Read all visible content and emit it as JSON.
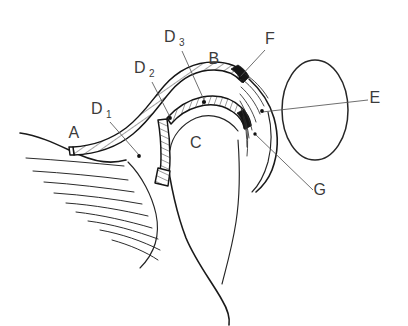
{
  "figure": {
    "background_color": "#ffffff",
    "ink_color": "#1a1a1a",
    "leader_color": "#555555",
    "width": 408,
    "height": 326
  },
  "labels": [
    {
      "id": "A",
      "text": "A",
      "subscript": "",
      "x": 74,
      "y": 138,
      "has_leader": false,
      "dot": null
    },
    {
      "id": "B",
      "text": "B",
      "subscript": "",
      "x": 214,
      "y": 64,
      "has_leader": false,
      "dot": null
    },
    {
      "id": "C",
      "text": "C",
      "subscript": "",
      "x": 196,
      "y": 148,
      "has_leader": false,
      "dot": null
    },
    {
      "id": "D1",
      "text": "D",
      "subscript": "1",
      "x": 97,
      "y": 114,
      "has_leader": true,
      "dot": [
        139,
        156
      ]
    },
    {
      "id": "D2",
      "text": "D",
      "subscript": "2",
      "x": 140,
      "y": 73,
      "has_leader": true,
      "dot": [
        170,
        118
      ]
    },
    {
      "id": "D3",
      "text": "D",
      "subscript": "3",
      "x": 170,
      "y": 42,
      "has_leader": true,
      "dot": [
        204,
        102
      ]
    },
    {
      "id": "E",
      "text": "E",
      "subscript": "",
      "x": 375,
      "y": 103,
      "has_leader": true,
      "dot": [
        262,
        111
      ]
    },
    {
      "id": "F",
      "text": "F",
      "subscript": "",
      "x": 270,
      "y": 44,
      "has_leader": true,
      "dot": [
        240,
        78
      ]
    },
    {
      "id": "G",
      "text": "G",
      "subscript": "",
      "x": 320,
      "y": 195,
      "has_leader": true,
      "dot": [
        255,
        134
      ]
    }
  ],
  "regions": {
    "hatched_band_upper_label": "B",
    "hatched_band_lower_label": "C",
    "oval_label": "E",
    "tissue_label": "A"
  },
  "counts": {
    "left_striations": 9,
    "right_fan_lines": 8,
    "hatch_ticks_upper": 26,
    "hatch_ticks_lower": 20
  }
}
